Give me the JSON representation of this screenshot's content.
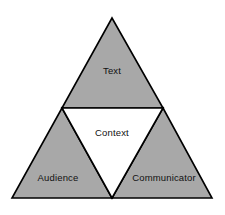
{
  "diagram": {
    "type": "nested-triangle",
    "background_color": "#ffffff",
    "fill_color": "#a8a8a8",
    "center_fill_color": "#ffffff",
    "stroke_color": "#000000",
    "stroke_width": 1.6,
    "geometry": {
      "apex": [
        112,
        18
      ],
      "bottom_left": [
        12,
        198
      ],
      "bottom_right": [
        212,
        198
      ],
      "mid_left": [
        62,
        108
      ],
      "mid_right": [
        163,
        108
      ],
      "mid_bottom": [
        112,
        198
      ]
    },
    "regions": [
      {
        "id": "top",
        "label": "Text",
        "label_x": 112,
        "label_y": 71,
        "filled": true,
        "points": "112,18 62,108 163,108"
      },
      {
        "id": "center",
        "label": "Context",
        "label_x": 112,
        "label_y": 133,
        "filled": false,
        "points": "62,108 163,108 112,198"
      },
      {
        "id": "bottom-left",
        "label": "Audience",
        "label_x": 58,
        "label_y": 178,
        "filled": true,
        "points": "62,108 112,198 12,198"
      },
      {
        "id": "bottom-right",
        "label": "Communicator",
        "label_x": 164,
        "label_y": 178,
        "filled": true,
        "points": "163,108 212,198 112,198"
      }
    ]
  }
}
